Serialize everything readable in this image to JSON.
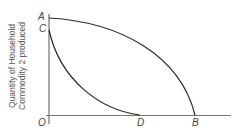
{
  "diagram": {
    "type": "production-possibility-curves",
    "y_axis_label_line1": "Quantity of Household",
    "y_axis_label_line2": "Commodity 2 produced",
    "points": {
      "origin": "O",
      "a": "A",
      "b": "B",
      "c": "C",
      "d": "D"
    },
    "curves": [
      {
        "name": "AB",
        "shape": "concave frontier from A on y-axis to B on x-axis"
      },
      {
        "name": "CD",
        "shape": "convex curve from C on y-axis to D on x-axis"
      }
    ],
    "colors": {
      "line": "#2a2a2a",
      "axis": "#555555",
      "text": "#444444"
    }
  }
}
